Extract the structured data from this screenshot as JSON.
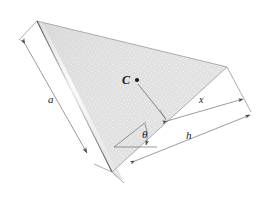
{
  "figure": {
    "background_color": "#ffffff",
    "plate": {
      "fill_color": "#dcdcdc",
      "edge_color": "#3d3d3d",
      "highlight_color": "#ffffff",
      "texture": "stipple"
    },
    "labels": {
      "side_a": "a",
      "distance_x": "x",
      "height_h": "h",
      "angle_theta": "θ",
      "centroid": "C"
    },
    "icons": {
      "centroid_dot": "centroid-dot",
      "arrowhead": "arrowhead"
    },
    "colors": {
      "dimension_line": "#6e6e6e",
      "extension_line": "#8a8a8a",
      "leader_line": "#5a5a5a",
      "label_text": "#1a1a1a"
    }
  }
}
